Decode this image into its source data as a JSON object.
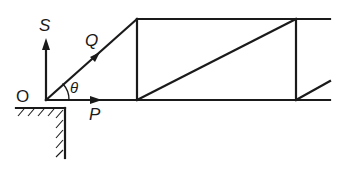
{
  "diagram": {
    "type": "truss force diagram",
    "labels": {
      "origin": "O",
      "force_s": "S",
      "force_q": "Q",
      "force_p": "P",
      "angle": "θ"
    },
    "colors": {
      "line": "#1a1a1a",
      "background": "#ffffff"
    }
  }
}
